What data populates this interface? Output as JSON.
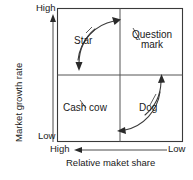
{
  "diagram": {
    "name": "BCG growth-share matrix",
    "axes": {
      "y": {
        "title": "Market growth rate",
        "high_label": "High",
        "low_label": "Low",
        "direction": "up"
      },
      "x": {
        "title": "Relative maket share",
        "high_label": "High",
        "low_label": "Low",
        "direction": "left"
      }
    },
    "quadrants": [
      {
        "id": "star",
        "label": "Star",
        "position": "top-left"
      },
      {
        "id": "question-mark",
        "label_line1": "Question",
        "label_line2": "mark",
        "position": "top-right"
      },
      {
        "id": "cash-cow",
        "label": "Cash cow",
        "position": "bottom-left"
      },
      {
        "id": "dog",
        "label": "Dog",
        "position": "bottom-right"
      }
    ],
    "flow_arrows": [
      {
        "id": "arc-top",
        "from": "Star",
        "to": "Question mark",
        "points": "right"
      },
      {
        "id": "arc-right",
        "from": "Dog",
        "to": "Question mark",
        "points": "up"
      },
      {
        "id": "arc-left",
        "from": "Star",
        "to": "Cash cow",
        "points": "down"
      },
      {
        "id": "arc-bottom",
        "from": "Dog",
        "to": "Cash cow",
        "points": "left"
      }
    ],
    "colors": {
      "stroke": "#3a3a3a",
      "text": "#1a1a1a",
      "background": "#ffffff"
    }
  }
}
